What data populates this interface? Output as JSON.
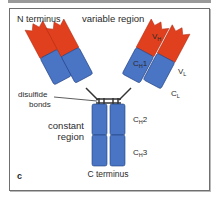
{
  "figure": {
    "panel_label": "c",
    "labels": {
      "n_terminus": "N terminus",
      "variable_region": "variable region",
      "vh": "V",
      "vh_sub": "H",
      "vl": "V",
      "vl_sub": "L",
      "ch1": "C",
      "ch1_sub": "H",
      "ch1_num": "1",
      "cl": "C",
      "cl_sub": "L",
      "disulfide_line1": "disulfide",
      "disulfide_line2": "bonds",
      "constant_line1": "constant",
      "constant_line2": "region",
      "ch2": "C",
      "ch2_sub": "H",
      "ch2_num": "2",
      "ch3": "C",
      "ch3_sub": "H",
      "ch3_num": "3",
      "c_terminus": "C terminus"
    },
    "colors": {
      "variable": "#e0401e",
      "constant": "#4a74c4",
      "outline": "#1f3f80",
      "frame": "#6f6f6f"
    }
  }
}
